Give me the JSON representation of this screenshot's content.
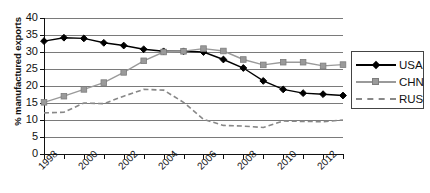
{
  "chart_data": {
    "type": "line",
    "title": "",
    "xlabel": "",
    "ylabel": "% manufactured exports",
    "x": [
      1998,
      1999,
      2000,
      2001,
      2002,
      2003,
      2004,
      2005,
      2006,
      2007,
      2008,
      2009,
      2010,
      2011,
      2012,
      2013
    ],
    "xtick_labels": [
      "1998",
      "2000",
      "2002",
      "2004",
      "2006",
      "2008",
      "2010",
      "2012"
    ],
    "ytick_labels": [
      "0",
      "5",
      "10",
      "15",
      "20",
      "25",
      "30",
      "35",
      "40"
    ],
    "ylim": [
      0,
      40
    ],
    "xlim": [
      1998,
      2013
    ],
    "grid": true,
    "legend_position": "right",
    "series": [
      {
        "name": "USA",
        "color": "#000000",
        "marker": "diamond",
        "linestyle": "solid",
        "values": [
          33.2,
          34.2,
          34.0,
          32.7,
          31.9,
          30.8,
          30.2,
          30.2,
          30.0,
          27.8,
          25.3,
          21.5,
          19.0,
          17.9,
          17.6,
          17.2
        ]
      },
      {
        "name": "CHN",
        "color": "#9a9a9a",
        "marker": "square",
        "linestyle": "solid",
        "values": [
          15.2,
          17.0,
          19.0,
          21.0,
          24.0,
          27.4,
          30.0,
          30.2,
          31.0,
          30.3,
          27.8,
          26.2,
          27.0,
          27.0,
          25.9,
          26.3
        ]
      },
      {
        "name": "RUS",
        "color": "#888888",
        "marker": "none",
        "linestyle": "dashed",
        "values": [
          12.1,
          12.3,
          15.0,
          14.8,
          17.0,
          19.0,
          18.8,
          15.2,
          10.2,
          8.4,
          8.2,
          7.8,
          9.7,
          9.6,
          9.5,
          10.0
        ]
      }
    ]
  },
  "legend": {
    "items": [
      {
        "label": "USA"
      },
      {
        "label": "CHN"
      },
      {
        "label": "RUS"
      }
    ]
  },
  "axes": {
    "y_title": "% manufactured exports"
  }
}
